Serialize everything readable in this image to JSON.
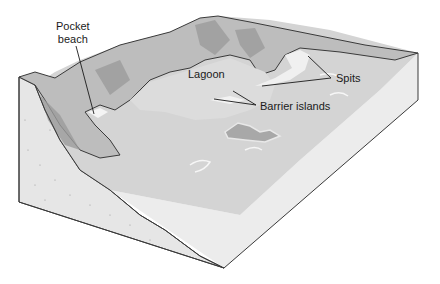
{
  "diagram": {
    "labels": {
      "pocket_beach_line1": "Pocket",
      "pocket_beach_line2": "beach",
      "lagoon": "Lagoon",
      "spits": "Spits",
      "barrier_islands": "Barrier islands"
    }
  },
  "colors": {
    "outline": "#3a3a3a",
    "sea_top": "#d6d6d6",
    "sea_front_face": "#e4e4e4",
    "land_light": "#c4c4c4",
    "land_mid": "#a8a8a8",
    "land_dark": "#8a8a8a",
    "cliff_face": "#e8e8e8",
    "beach": "#f2f2f2"
  }
}
